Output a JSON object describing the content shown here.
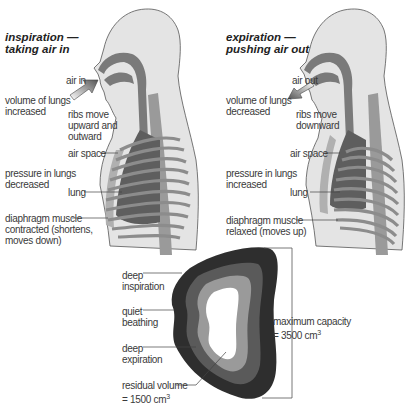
{
  "panels": {
    "inspiration": {
      "title_line1": "inspiration —",
      "title_line2": "taking air in",
      "air_label": "air in",
      "volume": "volume of lungs\nincreased",
      "ribs": "ribs move\nupward and\noutward",
      "air_space": "air space",
      "pressure": "pressure in lungs\ndecreased",
      "lung": "lung",
      "diaphragm": "diaphragm muscle\ncontracted (shortens,\nmoves down)"
    },
    "expiration": {
      "title_line1": "expiration —",
      "title_line2": "pushing air out",
      "air_label": "air out",
      "volume": "volume of lungs\ndecreased",
      "ribs": "ribs move\ndownward",
      "air_space": "air space",
      "pressure": "pressure in lungs\nincreased",
      "lung": "lung",
      "diaphragm": "diaphragm muscle\nrelaxed (moves up)"
    }
  },
  "capacity": {
    "deep_inspiration": "deep\ninspiration",
    "quiet_breathing": "quiet\nbeathing",
    "deep_expiration": "deep\nexpiration",
    "residual_volume": "residual volume\n= 1500 cm",
    "residual_exp": "3",
    "maximum_capacity": "maximum capacity\n= 3500 cm",
    "maximum_exp": "3"
  },
  "colors": {
    "skin": "#e4e4e4",
    "airway": "#7a7a7a",
    "lung": "#5e5e5e",
    "rib": "#8c8c8c",
    "layer_outer": "#2e2e2e",
    "layer_2": "#5a5a5a",
    "layer_3": "#9a9a9a",
    "layer_inner": "#ffffff"
  }
}
